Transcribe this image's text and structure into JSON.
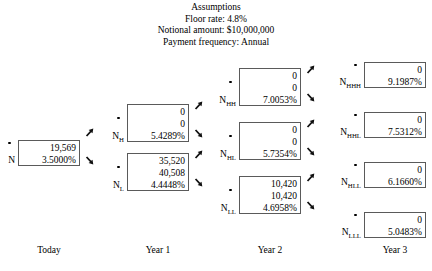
{
  "header": {
    "clipped_line": "Exhibit: Valuation of an interest rate floor",
    "title": "Assumptions",
    "lines": [
      "Floor rate: 4.8%",
      "Notional amount: $10,000,000",
      "Payment frequency: Annual"
    ]
  },
  "columns": [
    {
      "label": "Today"
    },
    {
      "label": "Year 1"
    },
    {
      "label": "Year 2"
    },
    {
      "label": "Year 3"
    }
  ],
  "nodes": [
    {
      "id": "N",
      "label": "N",
      "sub": "",
      "rows": [
        "19,569",
        "3.5000%"
      ]
    },
    {
      "id": "NH",
      "label": "N",
      "sub": "H",
      "rows": [
        "0",
        "0",
        "5.4289%"
      ]
    },
    {
      "id": "NL",
      "label": "N",
      "sub": "L",
      "rows": [
        "35,520",
        "40,508",
        "4.4448%"
      ]
    },
    {
      "id": "NHH",
      "label": "N",
      "sub": "HH",
      "rows": [
        "0",
        "0",
        "7.0053%"
      ]
    },
    {
      "id": "NHL",
      "label": "N",
      "sub": "HL",
      "rows": [
        "0",
        "0",
        "5.7354%"
      ]
    },
    {
      "id": "NLL",
      "label": "N",
      "sub": "LL",
      "rows": [
        "10,420",
        "10,420",
        "4.6958%"
      ]
    },
    {
      "id": "NHHH",
      "label": "N",
      "sub": "HHH",
      "rows": [
        "0",
        "9.1987%"
      ]
    },
    {
      "id": "NHHL",
      "label": "N",
      "sub": "HHL",
      "rows": [
        "0",
        "7.5312%"
      ]
    },
    {
      "id": "NHLL",
      "label": "N",
      "sub": "HLL",
      "rows": [
        "0",
        "6.1660%"
      ]
    },
    {
      "id": "NLLL",
      "label": "N",
      "sub": "LLL",
      "rows": [
        "0",
        "5.0483%"
      ]
    }
  ]
}
